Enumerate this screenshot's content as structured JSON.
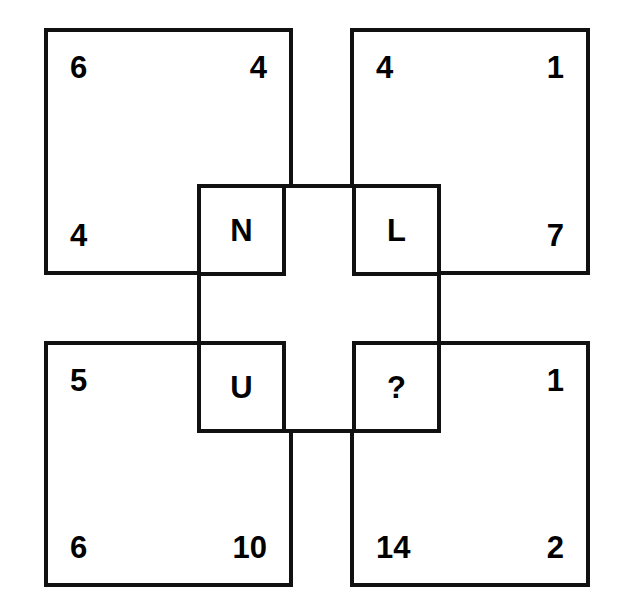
{
  "puzzle": {
    "type": "visual-number-logic-puzzle",
    "layout": "2x2 grid of squares with a central overlapping square forming a cross",
    "quadrants": [
      {
        "id": "top-left",
        "name": "quadrant-top-left",
        "corners": {
          "top_left": "6",
          "top_right": "4",
          "bottom_left": "4",
          "bottom_right": ""
        }
      },
      {
        "id": "top-right",
        "name": "quadrant-top-right",
        "corners": {
          "top_left": "4",
          "top_right": "1",
          "bottom_left": "",
          "bottom_right": "7"
        }
      },
      {
        "id": "bottom-left",
        "name": "quadrant-bottom-left",
        "corners": {
          "top_left": "5",
          "top_right": "",
          "bottom_left": "6",
          "bottom_right": "10"
        }
      },
      {
        "id": "bottom-right",
        "name": "quadrant-bottom-right",
        "corners": {
          "top_left": "",
          "top_right": "1",
          "bottom_left": "14",
          "bottom_right": "2"
        }
      }
    ],
    "center_cells": [
      {
        "id": "cell-n",
        "position": "top-left",
        "label": "N"
      },
      {
        "id": "cell-l",
        "position": "top-right",
        "label": "L"
      },
      {
        "id": "cell-u",
        "position": "bottom-left",
        "label": "U"
      },
      {
        "id": "cell-q",
        "position": "bottom-right",
        "label": "?"
      }
    ],
    "colors": {
      "line": "#111111",
      "text": "#000000",
      "background": "#ffffff"
    }
  }
}
